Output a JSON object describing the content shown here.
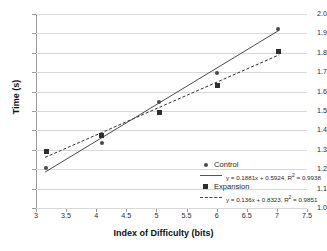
{
  "chart_data": {
    "type": "scatter",
    "title": "",
    "xlabel": "Index of Difficulty (bits)",
    "ylabel": "Time (s)",
    "xlim": [
      3,
      7.5
    ],
    "ylim": [
      1.0,
      2.0
    ],
    "xticks": [
      "3",
      "3.5",
      "4",
      "4.5",
      "5",
      "5.5",
      "6",
      "6.5",
      "7",
      "7.5"
    ],
    "yticks": [
      "1.0",
      "1.1",
      "1.2",
      "1.3",
      "1.4",
      "1.5",
      "1.6",
      "1.7",
      "1.8",
      "1.9",
      "2.0"
    ],
    "grid": "horizontal",
    "legend_position": "inside-lower-right",
    "series": [
      {
        "name": "Control",
        "marker": "circle",
        "line_style": "solid",
        "color": "#4a4a4a",
        "x": [
          3.17,
          4.09,
          5.05,
          6.01,
          7.02
        ],
        "y": [
          1.205,
          1.337,
          1.547,
          1.697,
          1.923
        ],
        "fit_equation": "y = 0.1881x + 0.5924, R² = 0.9938",
        "slope": 0.1881,
        "intercept": 0.5924,
        "r_squared": 0.9938
      },
      {
        "name": "Expansion",
        "marker": "square",
        "line_style": "dashed",
        "color": "#2e2e2e",
        "x": [
          3.17,
          4.09,
          5.05,
          6.01,
          7.02
        ],
        "y": [
          1.291,
          1.372,
          1.492,
          1.631,
          1.806
        ],
        "fit_equation": "y = 0.136x + 0.8323, R² = 0.9851",
        "slope": 0.136,
        "intercept": 0.8323,
        "r_squared": 0.9851
      }
    ]
  },
  "legend": {
    "control_label": "Control",
    "control_equation": "y = 0.1881x + 0.5924, R² = 0.9938",
    "expansion_label": "Expansion",
    "expansion_equation": "y = 0.136x + 0.8323, R² = 0.9851"
  }
}
